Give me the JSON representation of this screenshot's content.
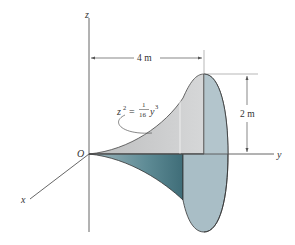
{
  "diagram": {
    "axes": {
      "z_label": "z",
      "y_label": "y",
      "x_label": "x",
      "origin_label": "O"
    },
    "dimensions": {
      "length": "4 m",
      "radius": "2 m"
    },
    "equation": {
      "lhs": "z",
      "lhs_exp": "2",
      "equals": "=",
      "num": "1",
      "den": "16",
      "var": "y",
      "var_exp": "3"
    },
    "colors": {
      "upper_surface": "#cfd1d2",
      "lower_surface": "#4d7b86",
      "end_disk": "#a9bec6",
      "axis": "#555555"
    }
  }
}
